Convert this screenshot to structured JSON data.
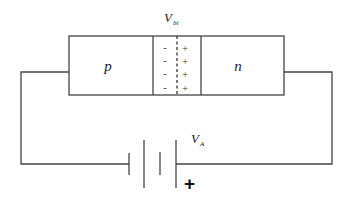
{
  "diagram": {
    "labels": {
      "builtin_voltage": "V",
      "builtin_voltage_sub": "bi",
      "p_region": "p",
      "n_region": "n",
      "applied_voltage": "V",
      "applied_voltage_sub": "A",
      "battery_polarity": "+"
    },
    "depletion": {
      "negative_charges": [
        "-",
        "-",
        "-",
        "-"
      ],
      "positive_charges": [
        "+",
        "+",
        "+",
        "+"
      ]
    },
    "colors": {
      "line": "#444444",
      "background": "#ffffff"
    }
  }
}
